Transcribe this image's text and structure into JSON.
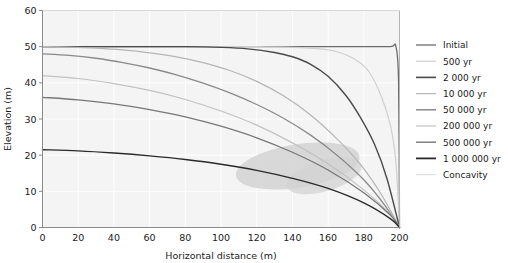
{
  "chart_data": {
    "type": "line",
    "title": "",
    "xlabel": "Horizontal distance (m)",
    "ylabel": "Elevation (m)",
    "xlim": [
      0,
      200
    ],
    "ylim": [
      0,
      60
    ],
    "xticks": [
      0,
      20,
      40,
      60,
      80,
      100,
      120,
      140,
      160,
      180,
      200
    ],
    "yticks": [
      0,
      10,
      20,
      30,
      40,
      50,
      60
    ],
    "grid": true,
    "grid_color": "#ffffff",
    "plot_background": "#f4f4f4",
    "legend_position": "right",
    "series": [
      {
        "name": "Initial",
        "color": "#6b6b6b",
        "width": 1.3,
        "x": [
          0,
          20,
          40,
          60,
          80,
          100,
          120,
          140,
          160,
          180,
          195,
          198,
          199.5,
          200
        ],
        "y": [
          50,
          50,
          50,
          50,
          50,
          50,
          50,
          50,
          50,
          50,
          50,
          50,
          40,
          0
        ]
      },
      {
        "name": "500 yr",
        "color": "#cfcfcf",
        "width": 1.2,
        "x": [
          0,
          20,
          40,
          60,
          80,
          100,
          120,
          140,
          155,
          165,
          175,
          183,
          190,
          195,
          198,
          200
        ],
        "y": [
          50,
          50,
          50,
          50,
          50,
          50,
          50,
          49.8,
          49.4,
          48.6,
          46.5,
          43,
          36,
          28,
          18,
          0
        ]
      },
      {
        "name": "2 000 yr",
        "color": "#4a4a4a",
        "width": 1.4,
        "x": [
          0,
          20,
          40,
          60,
          80,
          100,
          115,
          130,
          140,
          150,
          160,
          170,
          178,
          186,
          193,
          200
        ],
        "y": [
          50,
          50,
          50,
          50,
          50,
          49.8,
          49.4,
          48.4,
          47.2,
          45.2,
          41.8,
          36.5,
          30.5,
          23,
          13.5,
          0
        ]
      },
      {
        "name": "10 000 yr",
        "color": "#b5b5b5",
        "width": 1.2,
        "x": [
          0,
          15,
          30,
          45,
          60,
          75,
          90,
          105,
          120,
          135,
          150,
          165,
          178,
          190,
          200
        ],
        "y": [
          50,
          49.9,
          49.6,
          49.1,
          48.3,
          47.2,
          45.6,
          43.4,
          40.4,
          36.4,
          31.2,
          24.5,
          17.5,
          9.0,
          0
        ]
      },
      {
        "name": "50 000 yr",
        "color": "#8a8a8a",
        "width": 1.3,
        "x": [
          0,
          15,
          30,
          45,
          60,
          75,
          90,
          105,
          120,
          135,
          150,
          165,
          180,
          192,
          200
        ],
        "y": [
          48,
          47.6,
          46.8,
          45.6,
          44.1,
          42.2,
          39.9,
          37.2,
          34.0,
          30.2,
          25.6,
          20.0,
          13.2,
          6.0,
          0
        ]
      },
      {
        "name": "200 000 yr",
        "color": "#c2c2c2",
        "width": 1.2,
        "x": [
          0,
          20,
          40,
          60,
          80,
          100,
          120,
          140,
          160,
          180,
          195,
          200
        ],
        "y": [
          42,
          41.2,
          39.8,
          37.9,
          35.4,
          32.2,
          28.3,
          23.4,
          17.6,
          10.4,
          3.6,
          0
        ]
      },
      {
        "name": "500 000 yr",
        "color": "#777777",
        "width": 1.3,
        "x": [
          0,
          20,
          40,
          60,
          80,
          100,
          120,
          140,
          160,
          180,
          195,
          200
        ],
        "y": [
          36,
          35.3,
          34.2,
          32.6,
          30.6,
          28.0,
          24.8,
          20.8,
          15.9,
          9.6,
          3.4,
          0
        ]
      },
      {
        "name": "1 000 000 yr",
        "color": "#2a2a2a",
        "width": 1.4,
        "x": [
          0,
          20,
          40,
          60,
          80,
          100,
          120,
          140,
          160,
          180,
          195,
          200
        ],
        "y": [
          21.5,
          21.2,
          20.6,
          19.8,
          18.8,
          17.5,
          15.8,
          13.6,
          10.8,
          6.8,
          2.4,
          0
        ]
      }
    ],
    "shaded_region": {
      "name": "Concavity",
      "color": "#d2d2d2",
      "opacity": 0.85,
      "x_range": [
        108,
        178
      ],
      "y_range": [
        11,
        23
      ]
    }
  },
  "legend": {
    "items": [
      {
        "label": "Initial",
        "color": "#6b6b6b",
        "width": 1.3
      },
      {
        "label": "500 yr",
        "color": "#cfcfcf",
        "width": 1.2
      },
      {
        "label": "2 000 yr",
        "color": "#4a4a4a",
        "width": 1.6
      },
      {
        "label": "10 000 yr",
        "color": "#b5b5b5",
        "width": 1.2
      },
      {
        "label": "50 000 yr",
        "color": "#8a8a8a",
        "width": 1.5
      },
      {
        "label": "200 000 yr",
        "color": "#c2c2c2",
        "width": 1.2
      },
      {
        "label": "500 000 yr",
        "color": "#777777",
        "width": 1.4
      },
      {
        "label": "1 000 000 yr",
        "color": "#2a2a2a",
        "width": 1.8
      },
      {
        "label": "Concavity",
        "color": "#e0e0e0",
        "width": 1.2
      }
    ]
  }
}
